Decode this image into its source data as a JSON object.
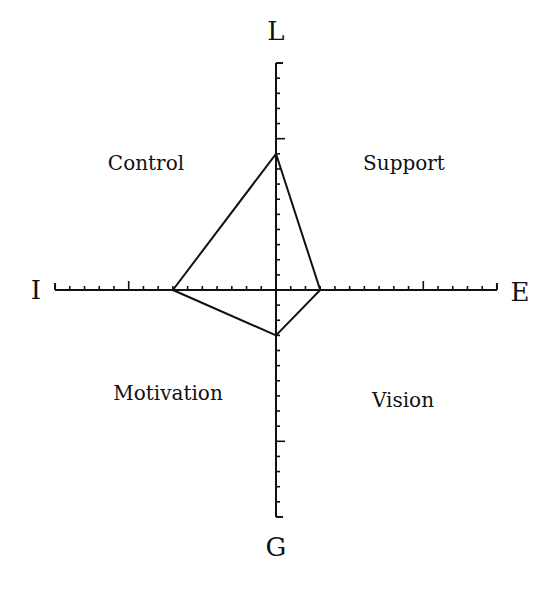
{
  "diagram": {
    "axes": {
      "top": "L",
      "bottom": "G",
      "left": "I",
      "right": "E"
    },
    "quadrants": {
      "top_left": "Control",
      "top_right": "Support",
      "bottom_left": "Motivation",
      "bottom_right": "Vision"
    },
    "scale": {
      "max": 15,
      "minor_tick_step": 1,
      "major_tick_step": 10
    },
    "profile": {
      "L": 9,
      "E": 3,
      "G": 3,
      "I": 7
    },
    "colors": {
      "line": "#111111",
      "background": "#ffffff"
    }
  },
  "chart_data": {
    "type": "radar",
    "axes": [
      "L",
      "E",
      "G",
      "I"
    ],
    "values": [
      9,
      3,
      3,
      7
    ],
    "axis_range": [
      0,
      15
    ],
    "quadrant_labels": [
      "Control",
      "Support",
      "Motivation",
      "Vision"
    ],
    "title": "",
    "grid": false
  }
}
